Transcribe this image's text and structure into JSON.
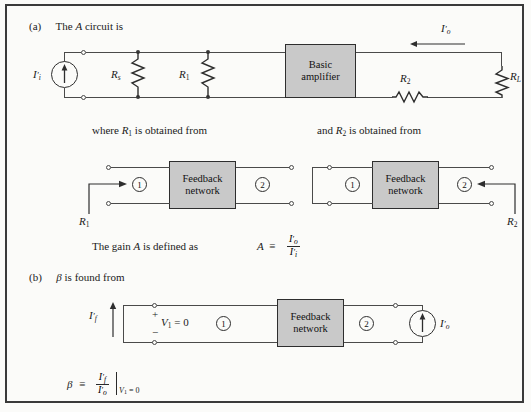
{
  "figure": {
    "part_a": {
      "label": "(a)",
      "caption_pre": "The",
      "caption_var": "A",
      "caption_post": "circuit is",
      "source_label": "I",
      "source_label_sub": "i",
      "rs_label": "R",
      "rs_sub": "s",
      "r1_label": "R",
      "r1_sub": "1",
      "amplifier_line1": "Basic",
      "amplifier_line2": "amplifier",
      "r2_label": "R",
      "r2_sub": "2",
      "rl_label": "R",
      "rl_sub": "L",
      "iout_label": "I",
      "iout_sub": "o"
    },
    "middle": {
      "left_caption_pre": "where",
      "left_caption_var": "R",
      "left_caption_sub": "1",
      "left_caption_post": "is obtained from",
      "right_caption_pre": "and",
      "right_caption_var": "R",
      "right_caption_sub": "2",
      "right_caption_post": "is obtained from",
      "block_line1": "Feedback",
      "block_line2": "network",
      "port1": "1",
      "port2": "2",
      "left_arrow_label": "R",
      "left_arrow_sub": "1",
      "right_arrow_label": "R",
      "right_arrow_sub": "2"
    },
    "gain": {
      "text_pre": "The gain",
      "text_var": "A",
      "text_post": "is defined as",
      "eq_lhs": "A",
      "eq_rel": "≡",
      "num": "I",
      "num_sub": "o",
      "den": "I",
      "den_sub": "i"
    },
    "part_b": {
      "label": "(b)",
      "caption_var": "β",
      "caption_post": "is found from",
      "if_label": "I",
      "if_sub": "f",
      "plus": "+",
      "minus": "−",
      "v1_text": "V",
      "v1_sub": "1",
      "v1_eq": "= 0",
      "port1": "1",
      "port2": "2",
      "block_line1": "Feedback",
      "block_line2": "network",
      "io_label": "I",
      "io_sub": "o",
      "beta_lhs": "β",
      "beta_rel": "≡",
      "beta_num": "I",
      "beta_num_sub": "f",
      "beta_den": "I",
      "beta_den_sub": "o",
      "cond_var": "V",
      "cond_sub": "1",
      "cond_eq": "= 0"
    },
    "colors": {
      "block_fill": "#c9c9c9",
      "wire": "#4a4a4a",
      "frame": "#3a3a3a",
      "background": "#fbfbf9"
    }
  }
}
